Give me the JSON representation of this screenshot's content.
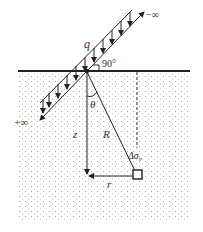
{
  "diagram": {
    "labels": {
      "load": "q",
      "angle_right": "90°",
      "theta": "θ",
      "depth": "z",
      "radius": "R",
      "horizontal": "r",
      "stress": "Δσ",
      "stress_sub": "v",
      "plus_infinity": "+∞",
      "minus_infinity": "−∞"
    },
    "colors": {
      "line": "#222222",
      "soil_dots": "#9a9a9a",
      "background": "#ffffff"
    }
  }
}
